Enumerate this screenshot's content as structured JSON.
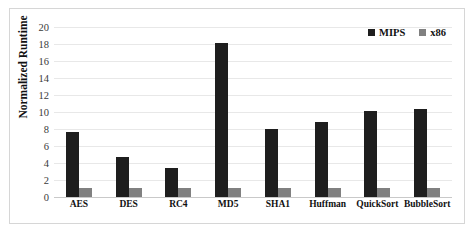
{
  "chart_data": {
    "type": "bar",
    "title": "",
    "xlabel": "",
    "ylabel": "Normalized Runtime",
    "ylim": [
      0,
      20
    ],
    "ytick_step": 2,
    "yticks": [
      0,
      2,
      4,
      6,
      8,
      10,
      12,
      14,
      16,
      18,
      20
    ],
    "grid": true,
    "legend_position": "top-right",
    "categories": [
      "AES",
      "DES",
      "RC4",
      "MD5",
      "SHA1",
      "Huffman",
      "QuickSort",
      "BubbleSort"
    ],
    "series": [
      {
        "name": "MIPS",
        "color": "#1e1e1e",
        "values": [
          7.7,
          4.7,
          3.4,
          18.1,
          8.0,
          8.8,
          10.1,
          10.4
        ]
      },
      {
        "name": "x86",
        "color": "#808080",
        "values": [
          1.1,
          1.1,
          1.1,
          1.1,
          1.1,
          1.1,
          1.1,
          1.1
        ]
      }
    ]
  },
  "legend": {
    "items": [
      {
        "label": "MIPS",
        "color": "#1e1e1e",
        "marker": "square-marker"
      },
      {
        "label": "x86",
        "color": "#808080",
        "marker": "square-marker"
      }
    ]
  },
  "axis": {
    "y_title": "Normalized Runtime"
  },
  "style": {
    "frame_border": "#d6d6d6",
    "gridline": "#e8e8e8",
    "baseline": "#c9c9c9",
    "background": "#ffffff"
  }
}
